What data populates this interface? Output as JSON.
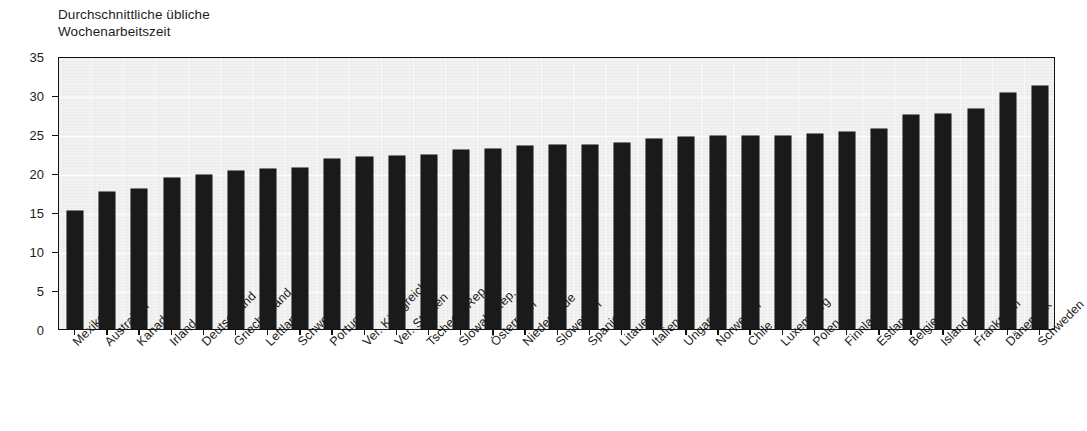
{
  "chart_data": {
    "type": "bar",
    "title": "Durchschnittliche übliche\nWochenarbeitszeit",
    "title_line1": "Durchschnittliche übliche",
    "title_line2": "Wochenarbeitszeit",
    "xlabel": "",
    "ylabel": "",
    "ylim": [
      0,
      35
    ],
    "yticks": [
      0,
      5,
      10,
      15,
      20,
      25,
      30,
      35
    ],
    "ytick_labels": [
      "0",
      "5",
      "10",
      "15",
      "20",
      "25",
      "30",
      "35"
    ],
    "grid": true,
    "legend": "none",
    "bar_color": "#1a1a1a",
    "plot_background": "#f2f2f2",
    "categories": [
      "Mexiko",
      "Australien",
      "Kanada",
      "Irland",
      "Deutschland",
      "Griechenland",
      "Lettland",
      "Schweiz",
      "Portugal",
      "Ver. Königreich",
      "Ver. Staaten",
      "Tschech. Rep.",
      "Slowak. Rep.",
      "Österreich",
      "Niederlande",
      "Slowenien",
      "Spanien",
      "Litauen",
      "Italien",
      "Ungarn",
      "Norwegen",
      "Chile",
      "Luxemburg",
      "Polen",
      "Finnland",
      "Estland",
      "Belgien",
      "Island",
      "Frankreich",
      "Dänemark",
      "Schweden"
    ],
    "values": [
      15.1,
      17.6,
      17.9,
      19.3,
      19.8,
      20.3,
      20.5,
      20.6,
      21.8,
      22.0,
      22.2,
      22.3,
      23.0,
      23.1,
      23.4,
      23.6,
      23.6,
      23.9,
      24.4,
      24.6,
      24.7,
      24.7,
      24.8,
      25.0,
      25.2,
      25.6,
      27.4,
      27.6,
      28.2,
      30.2,
      31.2
    ]
  }
}
